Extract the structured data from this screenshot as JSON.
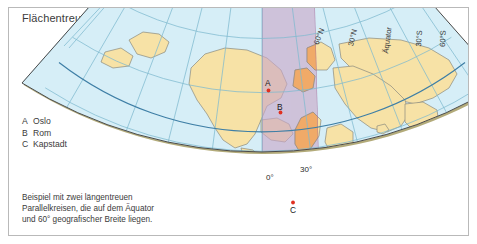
{
  "figure": {
    "title": "Flächentreue Kegelabbildung",
    "caption_lines": [
      "Beispiel mit zwei längentreuen",
      "Parallelkreisen, die auf dem Äquator",
      "und 60° geografischer Breite liegen."
    ],
    "caption_full": "Beispiel mit zwei längentreuen Parallelkreisen, die auf dem Äquator und 60° geografischer Breite liegen."
  },
  "legend": {
    "entries": [
      {
        "key": "A",
        "label": "Oslo"
      },
      {
        "key": "B",
        "label": "Rom"
      },
      {
        "key": "C",
        "label": "Kapstadt"
      }
    ]
  },
  "map": {
    "projection_name": "Flächentreue Kegelabbildung",
    "standard_parallels": [
      "0°",
      "60°"
    ],
    "edge_labels": [
      {
        "id": "lat-60n",
        "text": "60°N"
      },
      {
        "id": "lat-30n",
        "text": "30°N"
      },
      {
        "id": "lat-0",
        "text": "Äquator"
      },
      {
        "id": "lat-30s",
        "text": "30°S"
      },
      {
        "id": "lat-60s",
        "text": "60°S"
      }
    ],
    "meridian_labels": [
      {
        "id": "lon-0",
        "text": "0°"
      },
      {
        "id": "lon-30e",
        "text": "30°"
      }
    ],
    "city_markers": [
      {
        "key": "A",
        "name": "Oslo"
      },
      {
        "key": "B",
        "name": "Rom"
      },
      {
        "key": "C",
        "name": "Kapstadt"
      }
    ]
  },
  "colors": {
    "ocean": "#d6eef7",
    "land": "#f7e2a6",
    "highlight_band_ocean": "#c9a6c8",
    "highlight_band_land": "#f2a964",
    "graticule": "#7fb9cf",
    "standard_parallel": "#3f7fa6",
    "coastline": "#8a8a7e",
    "outline": "#4a4a4a",
    "edge_shadow": "#b3ab7a",
    "marker": "#e03020",
    "frame": "#b9b9b9",
    "text": "#3b3b3b",
    "background": "#ffffff"
  }
}
